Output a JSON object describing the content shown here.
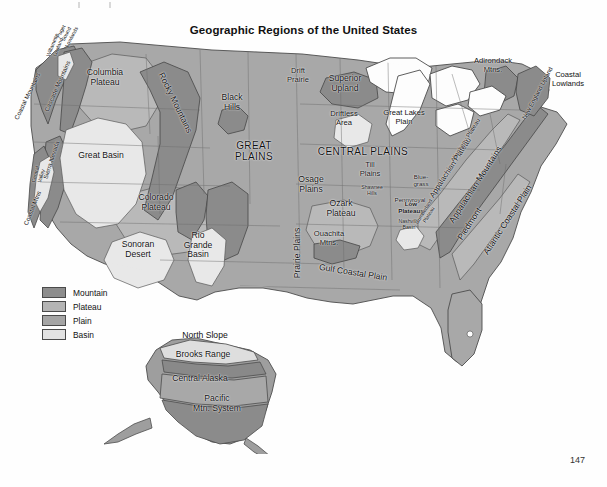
{
  "page": {
    "title": "Geographic Regions of the United States",
    "page_number": "147"
  },
  "legend": {
    "items": [
      {
        "label": "Mountain",
        "color": "#8d8d8d"
      },
      {
        "label": "Plateau",
        "color": "#b4b4b4"
      },
      {
        "label": "Plain",
        "color": "#a5a5a5"
      },
      {
        "label": "Basin",
        "color": "#e2e2e2"
      }
    ]
  },
  "map": {
    "regions": [
      {
        "name": "Puget Sound Lowlands",
        "label": "Puget\nSound\nLowlands",
        "x": 66,
        "y": 34,
        "rot": -62,
        "size": "xs",
        "class": ""
      },
      {
        "name": "Coastal Mountains",
        "label": "Coastal Mountains",
        "x": 27,
        "y": 96,
        "rot": -64,
        "size": "sm",
        "class": ""
      },
      {
        "name": "Cascade Mountains",
        "label": "Cascade Mountains",
        "x": 57,
        "y": 86,
        "rot": -66,
        "size": "sm",
        "class": ""
      },
      {
        "name": "Willamette Lowland",
        "label": "Willamette\nLowland",
        "x": 55,
        "y": 46,
        "rot": -68,
        "size": "xs",
        "class": ""
      },
      {
        "name": "Columbia Plateau",
        "label": "Columbia\nPlateau",
        "x": 105,
        "y": 78,
        "rot": 0,
        "size": "med",
        "class": ""
      },
      {
        "name": "Rocky Mountains",
        "label": "Rocky Mountains",
        "x": 175,
        "y": 103,
        "rot": 64,
        "size": "med",
        "class": ""
      },
      {
        "name": "Sierra Nevada",
        "label": "Sierra Nevada",
        "x": 51,
        "y": 160,
        "rot": -72,
        "size": "sm",
        "class": ""
      },
      {
        "name": "Central Valley",
        "label": "Central\nValley",
        "x": 38,
        "y": 175,
        "rot": -74,
        "size": "xs",
        "class": ""
      },
      {
        "name": "Coastal Mtns",
        "label": "Coastal Mtns",
        "x": 32,
        "y": 208,
        "rot": -68,
        "size": "sm",
        "class": ""
      },
      {
        "name": "Great Basin",
        "label": "Great Basin",
        "x": 101,
        "y": 156,
        "rot": 0,
        "size": "med",
        "class": ""
      },
      {
        "name": "Colorado Plateau",
        "label": "Colorado\nPlateau",
        "x": 156,
        "y": 203,
        "rot": 0,
        "size": "med",
        "class": ""
      },
      {
        "name": "Sonoran Desert",
        "label": "Sonoran\nDesert",
        "x": 138,
        "y": 250,
        "rot": 0,
        "size": "med",
        "class": ""
      },
      {
        "name": "Rio Grande Basin",
        "label": "Rio\nGrande\nBasin",
        "x": 198,
        "y": 245,
        "rot": 0,
        "size": "med",
        "class": ""
      },
      {
        "name": "Black Hills",
        "label": "Black\nHills",
        "x": 232,
        "y": 103,
        "rot": 0,
        "size": "med",
        "class": ""
      },
      {
        "name": "Great Plains",
        "label": "GREAT\nPLAINS",
        "x": 254,
        "y": 151,
        "rot": 0,
        "size": "big",
        "class": ""
      },
      {
        "name": "Drift Prairie",
        "label": "Drift\nPrairie",
        "x": 298,
        "y": 76,
        "rot": 0,
        "size": "",
        "class": ""
      },
      {
        "name": "Superior Upland",
        "label": "Superior\nUpland",
        "x": 345,
        "y": 84,
        "rot": 0,
        "size": "med",
        "class": ""
      },
      {
        "name": "Driftless Area",
        "label": "Driftless\nArea",
        "x": 344,
        "y": 119,
        "rot": 0,
        "size": "",
        "class": ""
      },
      {
        "name": "Great Lakes Plain",
        "label": "Great Lakes\nPlain",
        "x": 404,
        "y": 118,
        "rot": 0,
        "size": "",
        "class": ""
      },
      {
        "name": "Central Plains",
        "label": "CENTRAL PLAINS",
        "x": 363,
        "y": 151,
        "rot": 0,
        "size": "big",
        "class": ""
      },
      {
        "name": "Till Plains",
        "label": "Till\nPlains",
        "x": 370,
        "y": 170,
        "rot": 0,
        "size": "",
        "class": ""
      },
      {
        "name": "Shawnee Hills",
        "label": "Shawnee\nHills",
        "x": 372,
        "y": 190,
        "rot": 0,
        "size": "xs",
        "class": ""
      },
      {
        "name": "Bluegrass",
        "label": "Blue-\ngrass",
        "x": 421,
        "y": 180,
        "rot": 0,
        "size": "sm",
        "class": ""
      },
      {
        "name": "Pennyroyal Low Plateaus",
        "label": "Pennyroyal",
        "x": 410,
        "y": 199,
        "rot": 0,
        "size": "sm",
        "class": ""
      },
      {
        "name": "Low Plateaus",
        "label": "Low\nPlateaus",
        "x": 411,
        "y": 207,
        "rot": 0,
        "size": "sm",
        "class": "bold"
      },
      {
        "name": "Nashville Basin",
        "label": "Nashville\nBasin",
        "x": 409,
        "y": 224,
        "rot": 0,
        "size": "xs",
        "class": ""
      },
      {
        "name": "Osage Plains",
        "label": "Osage\nPlains",
        "x": 311,
        "y": 185,
        "rot": 0,
        "size": "med",
        "class": ""
      },
      {
        "name": "Ozark Plateau",
        "label": "Ozark\nPlateau",
        "x": 341,
        "y": 209,
        "rot": 0,
        "size": "med",
        "class": ""
      },
      {
        "name": "Ouachita Mtns",
        "label": "Ouachita\nMtns.",
        "x": 329,
        "y": 239,
        "rot": 0,
        "size": "",
        "class": ""
      },
      {
        "name": "Prairie Plains",
        "label": "Prairie Plains",
        "x": 298,
        "y": 253,
        "rot": -90,
        "size": "med",
        "class": ""
      },
      {
        "name": "Gulf Coastal Plain",
        "label": "Gulf Coastal Plain",
        "x": 353,
        "y": 273,
        "rot": 9,
        "size": "med",
        "class": ""
      },
      {
        "name": "Allegheny Plateau",
        "label": "Allegheny Plateau",
        "x": 465,
        "y": 140,
        "rot": -58,
        "size": "sm",
        "class": ""
      },
      {
        "name": "Appalachian Plateau",
        "label": "Appalachian Plateau",
        "x": 451,
        "y": 168,
        "rot": -57,
        "size": "",
        "class": ""
      },
      {
        "name": "Cumberland Plateau",
        "label": "Cumberland\nPlateau",
        "x": 426,
        "y": 213,
        "rot": -58,
        "size": "xs",
        "class": ""
      },
      {
        "name": "Appalachian Mountains",
        "label": "Appalachian Mountains",
        "x": 476,
        "y": 185,
        "rot": -57,
        "size": "med",
        "class": ""
      },
      {
        "name": "Piedmont",
        "label": "Piedmont",
        "x": 470,
        "y": 224,
        "rot": -57,
        "size": "med",
        "class": ""
      },
      {
        "name": "Atlantic Coastal Plain",
        "label": "Atlantic Coastal Plain",
        "x": 508,
        "y": 220,
        "rot": -57,
        "size": "med",
        "class": ""
      },
      {
        "name": "Adirondack Mtns",
        "label": "Adirondack\nMtns.",
        "x": 493,
        "y": 66,
        "rot": 0,
        "size": "",
        "class": ""
      },
      {
        "name": "New England Upland",
        "label": "New England Upland",
        "x": 537,
        "y": 93,
        "rot": -62,
        "size": "sm",
        "class": ""
      },
      {
        "name": "Coastal Lowlands",
        "label": "Coastal\nLowlands",
        "x": 568,
        "y": 80,
        "rot": 0,
        "size": "",
        "class": ""
      }
    ],
    "alaska_labels": [
      {
        "name": "North Slope",
        "label": "North Slope",
        "x": 205,
        "y": 336
      },
      {
        "name": "Brooks Range",
        "label": "Brooks Range",
        "x": 203,
        "y": 355
      },
      {
        "name": "Central Alaska",
        "label": "Central Alaska",
        "x": 200,
        "y": 379
      },
      {
        "name": "Pacific Mtn. System",
        "label": "Pacific\nMtn. System",
        "x": 217,
        "y": 404
      }
    ]
  }
}
